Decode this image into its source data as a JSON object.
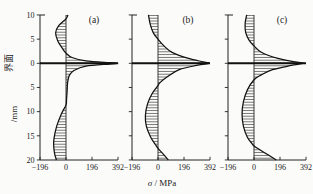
{
  "figure": {
    "background": "#fbfbfa",
    "ink_color": "#1c1c1c",
    "hatch_color": "#2a2a2a"
  },
  "chart_data": {
    "type": "line",
    "title": "",
    "xlabel_symbol": "σ",
    "xlabel_unit": " / MPa",
    "ylabel_interface": "界面",
    "ylabel_unit": "/mm",
    "xlim": [
      -196,
      392
    ],
    "x_ticks": [
      -196,
      0,
      196,
      392
    ],
    "x_tick_labels": [
      "−196",
      "0",
      "196",
      "392"
    ],
    "ylim_depth_mm": [
      -20,
      10
    ],
    "y_ticks": [
      10,
      5,
      0,
      -5,
      -10,
      -15,
      -20
    ],
    "y_tick_labels": [
      "10",
      "5",
      "0",
      "5",
      "10",
      "15",
      "20"
    ],
    "grid": false,
    "legend": "none",
    "panels": [
      {
        "label": "(a)",
        "peak_stress_mpa": 392,
        "points_sigma_depth": [
          [
            15,
            10
          ],
          [
            0,
            9.2
          ],
          [
            -55,
            7.8
          ],
          [
            -78,
            6.3
          ],
          [
            -62,
            4.6
          ],
          [
            -25,
            3
          ],
          [
            0,
            2.1
          ],
          [
            45,
            1.2
          ],
          [
            150,
            0.5
          ],
          [
            330,
            0.12
          ],
          [
            392,
            0
          ],
          [
            330,
            -0.15
          ],
          [
            150,
            -0.6
          ],
          [
            60,
            -1.5
          ],
          [
            25,
            -2.5
          ],
          [
            12,
            -4
          ],
          [
            8,
            -6
          ],
          [
            4,
            -7.5
          ],
          [
            0,
            -8.6
          ],
          [
            -35,
            -10.5
          ],
          [
            -70,
            -13
          ],
          [
            -90,
            -15.5
          ],
          [
            -93,
            -17
          ],
          [
            -85,
            -18.8
          ],
          [
            -72,
            -20
          ]
        ]
      },
      {
        "label": "(b)",
        "peak_stress_mpa": 385,
        "points_sigma_depth": [
          [
            -72,
            10
          ],
          [
            -58,
            8
          ],
          [
            -35,
            6.3
          ],
          [
            0,
            5
          ],
          [
            45,
            3.6
          ],
          [
            110,
            2.2
          ],
          [
            230,
            1
          ],
          [
            340,
            0.3
          ],
          [
            385,
            0
          ],
          [
            300,
            -0.4
          ],
          [
            160,
            -1.3
          ],
          [
            70,
            -2.8
          ],
          [
            15,
            -4
          ],
          [
            0,
            -4.6
          ],
          [
            -45,
            -6.3
          ],
          [
            -80,
            -8.5
          ],
          [
            -95,
            -10.8
          ],
          [
            -88,
            -13
          ],
          [
            -55,
            -15.3
          ],
          [
            -20,
            -16.8
          ],
          [
            0,
            -17.6
          ],
          [
            40,
            -18.8
          ],
          [
            78,
            -20
          ]
        ]
      },
      {
        "label": "(c)",
        "peak_stress_mpa": 370,
        "points_sigma_depth": [
          [
            -55,
            10
          ],
          [
            -67,
            8.2
          ],
          [
            -62,
            6.3
          ],
          [
            -35,
            4.7
          ],
          [
            0,
            3.6
          ],
          [
            55,
            2.3
          ],
          [
            180,
            1
          ],
          [
            310,
            0.3
          ],
          [
            370,
            0
          ],
          [
            280,
            -0.45
          ],
          [
            140,
            -1.3
          ],
          [
            55,
            -2.4
          ],
          [
            0,
            -3.4
          ],
          [
            -50,
            -5.5
          ],
          [
            -80,
            -8
          ],
          [
            -90,
            -10.5
          ],
          [
            -80,
            -13
          ],
          [
            -50,
            -15.3
          ],
          [
            -15,
            -16.6
          ],
          [
            0,
            -17.1
          ],
          [
            80,
            -18.5
          ],
          [
            168,
            -20
          ]
        ]
      }
    ]
  }
}
